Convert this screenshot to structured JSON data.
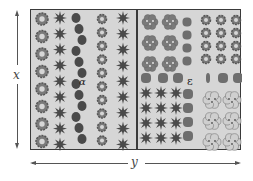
{
  "diagram": {
    "title": "",
    "labels": {
      "height_dimension": "x",
      "width_dimension": "y",
      "plot_marker_left": "α",
      "plot_marker_right": "ε"
    },
    "colors": {
      "bed_fill": "#d6d6d6",
      "border": "#3a3a3a",
      "plant_dark": "#4a4a4a",
      "plant_mid": "#7a7a7a",
      "stone": "#6e6e6e",
      "flower_light": "#cfcfcf"
    },
    "sections": [
      {
        "name": "left-half",
        "columns": [
          {
            "type": "round-flower",
            "count": 8
          },
          {
            "type": "spiky-plant",
            "count": 9
          },
          {
            "type": "climbing-vine",
            "count": 1
          },
          {
            "type": "small-round-flower",
            "count": 10
          },
          {
            "type": "spiky-plant",
            "count": 9
          }
        ]
      },
      {
        "name": "right-half",
        "groups": [
          {
            "type": "clustered-flower",
            "rows": 3,
            "cols": 2
          },
          {
            "type": "stone",
            "count": 12
          },
          {
            "type": "small-rosette",
            "rows": 4,
            "cols": 3
          },
          {
            "type": "spiky-plant",
            "rows": 4,
            "cols": 3
          },
          {
            "type": "large-pale-flower",
            "rows": 3,
            "cols": 2
          }
        ]
      }
    ]
  }
}
